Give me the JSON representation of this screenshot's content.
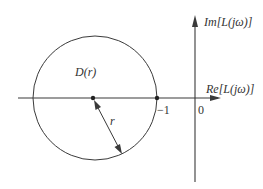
{
  "diagram": {
    "type": "nyquist-plane-disk",
    "colors": {
      "stroke": "#3a3a3a",
      "background": "#ffffff",
      "text": "#333333"
    },
    "axes": {
      "real_axis_label": "Re[L(jω)]",
      "imag_axis_label": "Im[L(jω)]",
      "origin_label": "0"
    },
    "points": {
      "minus_one_label": "−1"
    },
    "disk": {
      "label": "D(r)",
      "radius_label": "r"
    }
  }
}
